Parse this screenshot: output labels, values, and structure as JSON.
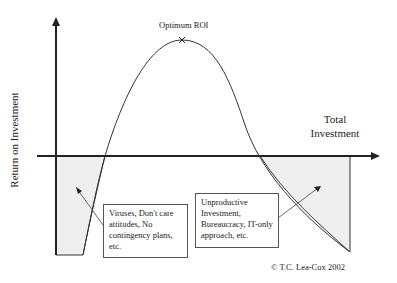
{
  "diagram": {
    "title": "",
    "y_axis_label": "Return on Investment",
    "x_axis_label_line1": "Total",
    "x_axis_label_line2": "Investment",
    "peak_label": "Optimum ROI",
    "left_note": "Viruses, Don't care attitudes, No contingency plans, etc.",
    "right_note": "Unproductive Investment, Bureaucracy, IT-only approach, etc.",
    "copyright": "© T.C. Lea-Cox 2002",
    "colors": {
      "line": "#333333",
      "shade": "#f0f0f0",
      "axis": "#222222"
    }
  }
}
